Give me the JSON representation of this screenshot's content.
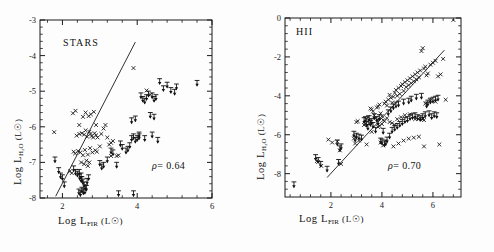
{
  "figure": {
    "axis_label_x": "Log L",
    "axis_label_x_sub": "FIR",
    "axis_label_x_unit": "(L☉)",
    "axis_label_y": "Log L",
    "axis_label_y_sub": "H₂O",
    "axis_label_y_unit": "(L☉)",
    "marker_style": "cross-and-downward-arrow-upper-limits",
    "line_color": "#1a1a1a",
    "point_color": "#111111"
  },
  "chart_data": [
    {
      "type": "scatter",
      "title": "STARS",
      "panel": "left",
      "xlabel": "Log L_FIR (L_sun)",
      "ylabel": "Log L_H2O (L_sun)",
      "xlim": [
        1.4,
        6.0
      ],
      "ylim": [
        -8.0,
        -3.0
      ],
      "xticks": [
        2,
        4,
        6
      ],
      "xticklabels": [
        "2",
        "4",
        "6"
      ],
      "yticks": [
        -3,
        -4,
        -5,
        -6,
        -7,
        -8
      ],
      "yticklabels": [
        "-3",
        "-4",
        "-5",
        "-6",
        "-7",
        "-8"
      ],
      "minor_ticks_per_interval": 5,
      "grid": false,
      "legend": "none",
      "annotation_rho_symbol": "ρ",
      "annotation_rho_text": "= 0.64",
      "rho": 0.64,
      "fit_line": {
        "x1": 1.82,
        "y1": -7.95,
        "x2": 3.95,
        "y2": -3.62
      },
      "detections_x": [
        1.78,
        2.38,
        2.45,
        2.52,
        2.58,
        2.62,
        2.66,
        2.72,
        2.75,
        2.78,
        2.82,
        2.86,
        2.9,
        2.94,
        2.3,
        2.34,
        2.42,
        2.48,
        2.55,
        2.6,
        2.68,
        2.74,
        2.8,
        2.88,
        2.92,
        3.0,
        3.04,
        3.1,
        3.15,
        3.2,
        3.25,
        3.3,
        3.35,
        2.55,
        2.62,
        2.7,
        2.76,
        2.84,
        2.5,
        2.58,
        2.64,
        2.68,
        2.72,
        3.9,
        4.25,
        4.35,
        2.45,
        2.35,
        2.28,
        3.45,
        3.5,
        2.9,
        2.2,
        2.25,
        3.3
      ],
      "detections_y": [
        -6.15,
        -6.25,
        -6.2,
        -6.18,
        -6.22,
        -6.1,
        -6.28,
        -6.14,
        -6.2,
        -6.26,
        -6.3,
        -6.18,
        -6.24,
        -6.3,
        -6.7,
        -6.75,
        -6.68,
        -6.72,
        -6.8,
        -6.65,
        -6.78,
        -6.6,
        -6.72,
        -6.66,
        -6.7,
        -6.55,
        -6.2,
        -6.05,
        -5.95,
        -6.3,
        -6.5,
        -6.45,
        -6.4,
        -5.72,
        -5.6,
        -5.7,
        -5.65,
        -5.58,
        -7.0,
        -7.05,
        -6.95,
        -7.1,
        -7.0,
        -4.35,
        -4.98,
        -5.1,
        -5.95,
        -5.55,
        -5.62,
        -6.82,
        -6.8,
        -5.95,
        -7.25,
        -7.3,
        -6.82
      ],
      "upper_limits_x": [
        1.8,
        1.9,
        1.95,
        2.0,
        2.05,
        2.45,
        2.5,
        2.52,
        2.55,
        2.58,
        2.62,
        2.66,
        2.7,
        2.3,
        2.35,
        2.4,
        2.46,
        2.5,
        3.0,
        3.05,
        3.1,
        3.2,
        3.3,
        3.35,
        3.45,
        3.55,
        3.6,
        3.7,
        3.75,
        3.8,
        3.85,
        3.9,
        3.95,
        4.0,
        4.05,
        4.1,
        4.15,
        4.2,
        4.25,
        4.3,
        4.4,
        4.45,
        4.5,
        4.6,
        4.7,
        4.8,
        4.9,
        5.0,
        5.05,
        5.6,
        3.5,
        3.9,
        2.52,
        2.56,
        2.6,
        2.64,
        4.35,
        4.45,
        3.85,
        4.2,
        4.05,
        3.95,
        4.4,
        4.55,
        2.48,
        2.44
      ],
      "upper_limits_y": [
        -7.0,
        -7.3,
        -7.45,
        -7.5,
        -7.7,
        -7.35,
        -7.45,
        -7.55,
        -7.62,
        -7.7,
        -7.78,
        -7.6,
        -7.5,
        -7.25,
        -7.35,
        -7.4,
        -7.48,
        -7.55,
        -7.1,
        -7.2,
        -7.15,
        -7.0,
        -6.75,
        -6.8,
        -7.15,
        -6.55,
        -6.65,
        -6.75,
        -6.7,
        -6.6,
        -6.4,
        -6.35,
        -6.45,
        -6.4,
        -6.3,
        -5.2,
        -5.3,
        -5.35,
        -5.25,
        -5.15,
        -5.2,
        -5.3,
        -5.25,
        -4.8,
        -5.0,
        -4.9,
        -5.05,
        -5.1,
        -4.95,
        -4.85,
        -7.95,
        -7.95,
        -7.85,
        -7.9,
        -7.88,
        -7.8,
        -5.75,
        -5.8,
        -5.9,
        -6.4,
        -6.35,
        -5.85,
        -6.3,
        -6.45,
        -7.95,
        -7.9
      ]
    },
    {
      "type": "scatter",
      "title": "HII",
      "panel": "right",
      "xlabel": "Log L_FIR (L_sun)",
      "ylabel": "Log L_H2O (L_sun)",
      "xlim": [
        0.2,
        7.1
      ],
      "ylim": [
        -9.2,
        0.0
      ],
      "xticks": [
        2,
        4,
        6
      ],
      "xticklabels": [
        "2",
        "4",
        "6"
      ],
      "yticks": [
        0,
        -2,
        -4,
        -6,
        -8
      ],
      "yticklabels": [
        "0",
        "-2",
        "-4",
        "-6",
        "-8"
      ],
      "minor_ticks_per_interval": 5,
      "grid": false,
      "legend": "none",
      "annotation_rho_symbol": "ρ",
      "annotation_rho_text": "= 0.70",
      "rho": 0.7,
      "fit_line": {
        "x1": 1.85,
        "y1": -8.2,
        "x2": 6.45,
        "y2": -1.65
      },
      "detections_x": [
        1.45,
        1.5,
        1.62,
        1.9,
        2.05,
        2.25,
        2.35,
        2.4,
        2.9,
        2.95,
        3.0,
        3.05,
        3.1,
        3.3,
        3.35,
        3.4,
        3.45,
        3.5,
        3.55,
        3.6,
        3.65,
        3.7,
        3.75,
        3.8,
        3.85,
        3.9,
        3.95,
        4.0,
        4.05,
        4.1,
        4.15,
        4.2,
        4.25,
        4.3,
        4.35,
        4.4,
        4.45,
        4.5,
        4.55,
        4.6,
        4.65,
        4.7,
        4.75,
        4.8,
        4.85,
        4.9,
        4.95,
        5.0,
        5.05,
        5.1,
        5.15,
        5.2,
        5.25,
        5.3,
        5.35,
        5.4,
        5.45,
        5.5,
        5.55,
        5.6,
        5.65,
        5.7,
        5.75,
        5.8,
        5.9,
        6.0,
        6.1,
        6.2,
        6.3,
        6.4,
        6.5,
        6.8,
        5.6,
        5.65,
        4.3,
        4.5,
        3.85,
        3.9,
        4.0,
        4.1,
        4.2,
        4.4,
        4.6,
        4.75,
        4.9,
        5.1,
        5.3,
        5.5,
        5.7,
        5.9,
        6.1,
        6.25,
        3.95,
        4.05,
        4.45,
        4.65,
        4.85,
        5.05,
        5.25,
        5.45,
        5.65,
        3.4,
        3.6,
        3.75
      ],
      "detections_y": [
        -7.35,
        -7.4,
        -7.6,
        -6.25,
        -6.4,
        -6.35,
        -6.8,
        -7.5,
        -6.2,
        -6.45,
        -5.35,
        -5.3,
        -6.3,
        -5.5,
        -5.45,
        -5.2,
        -5.1,
        -5.4,
        -4.65,
        -4.7,
        -4.8,
        -5.0,
        -5.15,
        -4.6,
        -4.55,
        -4.45,
        -4.9,
        -5.05,
        -5.25,
        -4.4,
        -4.3,
        -4.5,
        -4.2,
        -3.95,
        -4.1,
        -4.35,
        -4.05,
        -3.85,
        -3.7,
        -4.0,
        -3.6,
        -3.9,
        -3.5,
        -3.4,
        -3.75,
        -3.3,
        -3.55,
        -3.2,
        -3.45,
        -3.1,
        -3.35,
        -3.0,
        -3.25,
        -2.9,
        -3.15,
        -2.8,
        -3.05,
        -2.7,
        -1.7,
        -1.55,
        -2.6,
        -2.5,
        -2.95,
        -2.85,
        -2.4,
        -2.3,
        -2.2,
        -3.0,
        -2.9,
        -2.1,
        -4.2,
        -0.1,
        -5.2,
        -5.25,
        -5.35,
        -5.5,
        -5.6,
        -5.55,
        -5.45,
        -5.3,
        -5.15,
        -5.4,
        -5.2,
        -5.1,
        -5.0,
        -4.95,
        -5.2,
        -5.15,
        -4.4,
        -4.25,
        -4.3,
        -6.5,
        -6.4,
        -6.55,
        -6.6,
        -6.45,
        -6.3,
        -6.2,
        -6.15,
        -6.1,
        -6.6,
        -6.5,
        -5.85
      ],
      "upper_limits_x": [
        0.55,
        1.4,
        1.5,
        1.6,
        1.85,
        2.3,
        2.35,
        2.9,
        2.95,
        3.0,
        3.1,
        3.2,
        3.3,
        3.35,
        3.4,
        3.5,
        3.55,
        3.6,
        3.7,
        3.8,
        3.85,
        3.9,
        3.95,
        4.0,
        4.1,
        4.15,
        4.2,
        4.3,
        4.4,
        4.5,
        4.6,
        4.7,
        4.8,
        4.9,
        5.0,
        5.1,
        5.2,
        5.3,
        5.4,
        5.5,
        5.6,
        5.7,
        5.8,
        5.9,
        6.0,
        6.1,
        6.2,
        4.25,
        4.35,
        4.45,
        4.55,
        4.65,
        4.85,
        5.05,
        5.15,
        5.35,
        5.55,
        5.75,
        3.45,
        3.65,
        3.75,
        4.05,
        2.25,
        2.4,
        6.05,
        6.15,
        5.85,
        5.95
      ],
      "upper_limits_y": [
        -8.7,
        -7.3,
        -7.45,
        -7.65,
        -7.9,
        -7.55,
        -6.85,
        -6.1,
        -6.35,
        -6.2,
        -6.25,
        -6.3,
        -5.4,
        -5.35,
        -5.6,
        -5.3,
        -5.55,
        -5.45,
        -5.2,
        -5.35,
        -5.5,
        -5.25,
        -6.45,
        -6.5,
        -6.6,
        -6.55,
        -6.4,
        -6.2,
        -5.9,
        -5.8,
        -5.7,
        -5.6,
        -5.5,
        -5.4,
        -5.35,
        -5.25,
        -5.2,
        -5.15,
        -5.25,
        -5.3,
        -5.2,
        -5.1,
        -4.5,
        -4.4,
        -4.35,
        -4.3,
        -4.25,
        -5.0,
        -4.85,
        -4.7,
        -4.6,
        -4.55,
        -4.45,
        -4.4,
        -4.3,
        -4.2,
        -4.15,
        -4.6,
        -5.75,
        -5.65,
        -5.9,
        -5.95,
        -6.55,
        -6.75,
        -5.1,
        -5.15,
        -5.05,
        -5.2
      ]
    }
  ]
}
